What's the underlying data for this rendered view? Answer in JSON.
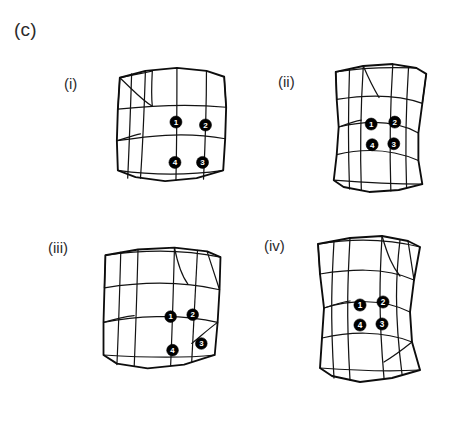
{
  "figure": {
    "panel_label": "(c)",
    "background_color": "#ffffff",
    "line_color": "#131313",
    "node_fill_color": "#000000",
    "node_text_color": "#ffffff"
  },
  "subpanels": [
    {
      "id": "i",
      "label": "(i)",
      "label_x": 64,
      "label_y": 76,
      "mesh_x": 108,
      "mesh_y": 60,
      "mesh_w": 128,
      "mesh_h": 128,
      "description": "deformed quadrilateral mesh, slightly sheared square",
      "nodes": [
        {
          "number": "1",
          "cx": 69,
          "cy": 63
        },
        {
          "number": "2",
          "cx": 99,
          "cy": 66
        },
        {
          "number": "3",
          "cx": 96,
          "cy": 104
        },
        {
          "number": "4",
          "cx": 68,
          "cy": 104
        }
      ]
    },
    {
      "id": "ii",
      "label": "(ii)",
      "label_x": 278,
      "label_y": 74,
      "mesh_x": 320,
      "mesh_y": 58,
      "mesh_w": 122,
      "mesh_h": 140,
      "description": "deformed quadrilateral mesh, waisted hourglass column",
      "nodes": [
        {
          "number": "1",
          "cx": 52,
          "cy": 67
        },
        {
          "number": "2",
          "cx": 76,
          "cy": 65
        },
        {
          "number": "3",
          "cx": 75,
          "cy": 87
        },
        {
          "number": "4",
          "cx": 53,
          "cy": 88
        }
      ]
    },
    {
      "id": "iii",
      "label": "(iii)",
      "label_x": 48,
      "label_y": 240,
      "mesh_x": 92,
      "mesh_y": 234,
      "mesh_w": 140,
      "mesh_h": 148,
      "description": "deformed quadrilateral mesh, wide trapezoid",
      "nodes": [
        {
          "number": "1",
          "cx": 82,
          "cy": 78
        },
        {
          "number": "2",
          "cx": 105,
          "cy": 76
        },
        {
          "number": "3",
          "cx": 114,
          "cy": 106
        },
        {
          "number": "4",
          "cx": 84,
          "cy": 113
        }
      ]
    },
    {
      "id": "iv",
      "label": "(iv)",
      "label_x": 264,
      "label_y": 238,
      "mesh_x": 302,
      "mesh_y": 232,
      "mesh_w": 132,
      "mesh_h": 156,
      "description": "deformed quadrilateral mesh, waisted column with skewed base",
      "nodes": [
        {
          "number": "1",
          "cx": 56,
          "cy": 73
        },
        {
          "number": "2",
          "cx": 79,
          "cy": 70
        },
        {
          "number": "3",
          "cx": 78,
          "cy": 92
        },
        {
          "number": "4",
          "cx": 56,
          "cy": 93
        }
      ]
    }
  ],
  "mesh_geometry": {
    "i": {
      "outline": "M 12 18 L 38 11 L 70 8 L 100 11 L 118 17 L 120 48 L 119 80 L 117 112 L 90 120 L 58 123 L 28 119 L 10 112 L 9 82 L 10 50 Z",
      "lines": [
        "M 12 18 C 36 13 44 12 45 11",
        "M 10 50 C 38 47 78 44 120 48",
        "M 9 82 C 36 78 76 72 119 80",
        "M 10 112 C 38 116 76 118 117 112",
        "M 38 11 C 37 42 36 76 33 120",
        "M 70 8 C 70 40 70 78 69 122",
        "M 100 11 C 100 42 99 80 97 121",
        "M 12 18 L 10 50",
        "M 118 17 L 120 48",
        "M 24 14 C 23 44 22 78 20 120",
        "M 12 18 C 30 35 34 40 45 47",
        "M 45 11 C 44 30 44 38 45 47",
        "M 9 82 C 22 78 28 76 33 75"
      ]
    },
    "ii": {
      "outline": "M 16 14 L 44 8 L 74 6 L 98 10 L 108 16 L 104 46 L 100 76 L 100 104 L 104 128 L 80 134 L 50 136 L 24 131 L 14 124 L 17 98 L 19 70 L 17 42 Z",
      "lines": [
        "M 17 42 C 42 38 76 36 104 46",
        "M 19 70 C 44 64 74 62 100 76",
        "M 17 98 C 42 92 72 92 100 104",
        "M 14 124 C 40 126 74 128 104 128",
        "M 16 14 C 40 10 74 9 98 10",
        "M 44 8 C 42 40 40 76 42 134",
        "M 74 6 C 72 38 70 74 72 135",
        "M 30 11 C 29 42 28 78 30 133",
        "M 90 9 C 88 40 86 76 88 132",
        "M 16 14 L 17 42",
        "M 108 16 L 104 46",
        "M 44 8 C 50 22 54 30 60 40",
        "M 19 70 C 30 66 36 64 42 63"
      ]
    },
    "iii": {
      "outline": "M 14 14 L 48 8 L 86 6 L 120 10 L 134 16 L 133 50 L 131 84 L 128 118 L 96 128 L 58 132 L 26 127 L 12 118 L 12 84 L 13 48 Z",
      "lines": [
        "M 13 48 C 44 43 90 40 133 50",
        "M 12 84 C 42 78 90 74 131 84",
        "M 12 118 C 44 120 90 122 128 118",
        "M 14 14 C 48 9 92 7 134 16",
        "M 48 8 C 47 44 46 84 44 130",
        "M 86 6 C 85 42 84 84 82 129",
        "M 30 11 C 29 46 28 84 26 128",
        "M 110 9 C 108 44 106 84 104 125",
        "M 14 14 L 13 48",
        "M 120 10 L 133 50",
        "M 86 6 C 90 26 94 36 100 44",
        "M 12 84 C 26 80 34 78 44 77",
        "M 131 84 C 120 92 114 98 104 106"
      ]
    },
    "iv": {
      "outline": "M 14 12 L 46 6 L 78 4 L 104 9 L 116 15 L 110 48 L 106 80 L 108 110 L 116 138 L 88 146 L 56 150 L 28 144 L 16 136 L 18 106 L 20 76 L 16 42 Z",
      "lines": [
        "M 16 42 C 42 38 80 34 110 48",
        "M 20 76 C 46 68 78 66 106 80",
        "M 18 106 C 44 100 78 98 108 110",
        "M 16 136 C 44 138 82 140 116 138",
        "M 14 12 C 44 7 80 6 116 15",
        "M 46 6 C 44 42 42 80 46 148",
        "M 78 4 C 76 40 74 78 80 146",
        "M 30 9 C 28 44 26 82 30 146",
        "M 96 8 C 92 42 90 80 98 142",
        "M 14 12 L 16 42",
        "M 104 9 L 110 48",
        "M 78 4 C 84 24 88 34 96 44",
        "M 20 76 C 32 72 38 70 46 69",
        "M 108 110 C 98 118 90 124 80 130"
      ]
    }
  }
}
